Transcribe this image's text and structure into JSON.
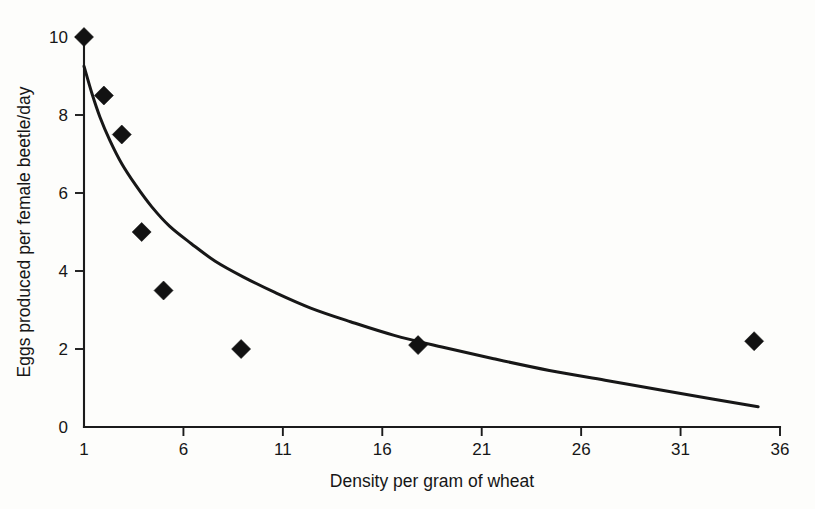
{
  "chart_data": {
    "type": "scatter",
    "title": "",
    "xlabel": "Density per gram of wheat",
    "ylabel": "Eggs produced per female beetle/day",
    "xlim": [
      1,
      36
    ],
    "ylim": [
      0,
      10
    ],
    "grid": false,
    "legend": "none",
    "xticks": [
      1,
      6,
      11,
      16,
      21,
      26,
      31,
      36
    ],
    "xtick_labels": [
      "1",
      "6",
      "11",
      "16",
      "21",
      "26",
      "31",
      "36"
    ],
    "yticks": [
      0,
      2,
      4,
      6,
      8,
      10
    ],
    "ytick_labels": [
      "0",
      "2",
      "4",
      "6",
      "8",
      "10"
    ],
    "series": [
      {
        "name": "Observed eggs per female beetle per day",
        "type": "scatter",
        "marker": "diamond",
        "color": "#121212",
        "points": [
          {
            "x": 1.0,
            "y": 10.0
          },
          {
            "x": 2.0,
            "y": 8.5
          },
          {
            "x": 2.9,
            "y": 7.5
          },
          {
            "x": 3.9,
            "y": 5.0
          },
          {
            "x": 5.0,
            "y": 3.5
          },
          {
            "x": 8.9,
            "y": 2.0
          },
          {
            "x": 17.8,
            "y": 2.1
          },
          {
            "x": 34.7,
            "y": 2.2
          }
        ]
      },
      {
        "name": "Fitted decline curve",
        "type": "line",
        "color": "#171717",
        "points": [
          {
            "x": 1.0,
            "y": 9.25
          },
          {
            "x": 1.4,
            "y": 8.55
          },
          {
            "x": 1.8,
            "y": 7.95
          },
          {
            "x": 2.3,
            "y": 7.35
          },
          {
            "x": 2.9,
            "y": 6.75
          },
          {
            "x": 3.6,
            "y": 6.2
          },
          {
            "x": 4.4,
            "y": 5.65
          },
          {
            "x": 5.3,
            "y": 5.15
          },
          {
            "x": 6.4,
            "y": 4.7
          },
          {
            "x": 7.6,
            "y": 4.25
          },
          {
            "x": 9.0,
            "y": 3.85
          },
          {
            "x": 10.6,
            "y": 3.45
          },
          {
            "x": 12.4,
            "y": 3.05
          },
          {
            "x": 14.4,
            "y": 2.7
          },
          {
            "x": 16.6,
            "y": 2.35
          },
          {
            "x": 19.0,
            "y": 2.05
          },
          {
            "x": 21.6,
            "y": 1.75
          },
          {
            "x": 24.4,
            "y": 1.45
          },
          {
            "x": 27.2,
            "y": 1.2
          },
          {
            "x": 30.0,
            "y": 0.95
          },
          {
            "x": 32.6,
            "y": 0.72
          },
          {
            "x": 34.9,
            "y": 0.52
          }
        ]
      }
    ]
  }
}
